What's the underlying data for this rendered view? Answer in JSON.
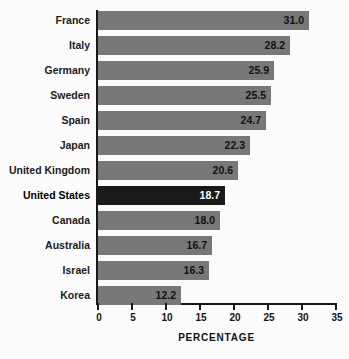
{
  "chart_data": {
    "type": "bar",
    "orientation": "horizontal",
    "title": "",
    "xlabel": "PERCENTAGE",
    "ylabel": "",
    "xlim": [
      0,
      35
    ],
    "xticks": [
      0,
      5,
      10,
      15,
      20,
      25,
      30,
      35
    ],
    "xtick_labels": [
      "0",
      "5",
      "10",
      "15",
      "20",
      "25",
      "30",
      "35"
    ],
    "grid": false,
    "legend": "none",
    "categories": [
      "France",
      "Italy",
      "Germany",
      "Sweden",
      "Spain",
      "Japan",
      "United Kingdom",
      "United States",
      "Canada",
      "Australia",
      "Israel",
      "Korea"
    ],
    "values": [
      31.0,
      28.2,
      25.9,
      25.5,
      24.7,
      22.3,
      20.6,
      18.7,
      18.0,
      16.7,
      16.3,
      12.2
    ],
    "value_labels": [
      "31.0",
      "28.2",
      "25.9",
      "25.5",
      "24.7",
      "22.3",
      "20.6",
      "18.7",
      "18.0",
      "16.7",
      "16.3",
      "12.2"
    ],
    "highlighted_category": "United States",
    "colors": {
      "bar": "#787878",
      "bar_highlight": "#1a1a1a",
      "bar_label": "#111111",
      "bar_label_highlight": "#ffffff",
      "axis": "#181818",
      "background": "#fbfbfb",
      "text": "#1c1c1c"
    }
  }
}
